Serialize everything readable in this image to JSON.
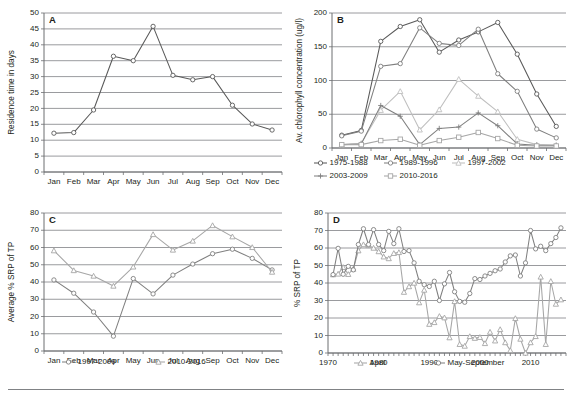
{
  "figure": {
    "name": "four-panel-limnology-figure",
    "panels": [
      "A",
      "B",
      "C",
      "D"
    ],
    "colors": {
      "line_dark": "#595959",
      "line_mid": "#7f7f7f",
      "line_light": "#a6a6a6",
      "line_lighter": "#bfbfbf",
      "grid": "#808285",
      "axis": "#6d6e71",
      "text": "#231f20"
    }
  },
  "panelA": {
    "letter": "A",
    "ylabel": "Residence time in days",
    "xlabel": "",
    "chart_data": {
      "type": "line",
      "title": "",
      "xlabel": "",
      "ylabel": "Residence time in days",
      "ylim": [
        0,
        50
      ],
      "yticks": [
        0,
        5,
        10,
        15,
        20,
        25,
        30,
        35,
        40,
        45,
        50
      ],
      "grid": true,
      "legend": "none",
      "categories": [
        "Jan",
        "Feb",
        "Mar",
        "Apr",
        "May",
        "Jun",
        "Jul",
        "Aug",
        "Sep",
        "Oct",
        "Nov",
        "Dec"
      ],
      "series": [
        {
          "name": "Residence time",
          "marker": "circle",
          "color": "#595959",
          "values": [
            12.2,
            12.4,
            19.5,
            36.4,
            35.0,
            45.8,
            30.4,
            29.0,
            30.0,
            21.0,
            15.1,
            13.2
          ]
        }
      ]
    }
  },
  "panelB": {
    "letter": "B",
    "ylabel": "Av. chlorophyll concentration (ug/l)",
    "chart_data": {
      "type": "line",
      "title": "",
      "xlabel": "",
      "ylabel": "Av. chlorophyll concentration (ug/l)",
      "ylim": [
        0,
        200
      ],
      "yticks": [
        0,
        50,
        100,
        150,
        200
      ],
      "grid": true,
      "legend": "bottom",
      "categories": [
        "Jan",
        "Feb",
        "Mar",
        "Apr",
        "May",
        "Jun",
        "Jul",
        "Aug",
        "Sep",
        "Oct",
        "Nov",
        "Dec"
      ],
      "series": [
        {
          "name": "1975-1988",
          "marker": "circle",
          "color": "#595959",
          "values": [
            19,
            26,
            158,
            180,
            190,
            142,
            160,
            172,
            186,
            139,
            80,
            32
          ]
        },
        {
          "name": "1989-1996",
          "marker": "circle",
          "color": "#7f7f7f",
          "values": [
            18,
            25,
            121,
            125,
            178,
            155,
            152,
            176,
            110,
            84,
            28,
            15
          ]
        },
        {
          "name": "1997-2002",
          "marker": "triangle",
          "color": "#bfbfbf",
          "values": [
            5,
            7,
            56,
            84,
            27,
            57,
            102,
            77,
            54,
            13,
            5,
            4
          ]
        },
        {
          "name": "2003-2009",
          "marker": "cross",
          "color": "#808080",
          "values": [
            5,
            6,
            63,
            47,
            5,
            29,
            31,
            52,
            33,
            6,
            4,
            4
          ]
        },
        {
          "name": "2010-2016",
          "marker": "square",
          "color": "#a6a6a6",
          "values": [
            5,
            5,
            11,
            13,
            4,
            11,
            16,
            23,
            14,
            4,
            3,
            3
          ]
        }
      ]
    }
  },
  "panelC": {
    "letter": "C",
    "ylabel": "Average  % SRP of TP",
    "chart_data": {
      "type": "line",
      "title": "",
      "xlabel": "",
      "ylabel": "Average  % SRP of TP",
      "ylim": [
        0,
        80
      ],
      "yticks": [
        0,
        10,
        20,
        30,
        40,
        50,
        60,
        70,
        80
      ],
      "grid": true,
      "legend": "bottom",
      "categories": [
        "Jan",
        "Feb",
        "Mar",
        "Apr",
        "May",
        "Jun",
        "Jul",
        "Aug",
        "Sep",
        "Oct",
        "Nov",
        "Dec"
      ],
      "series": [
        {
          "name": "1997-2009",
          "marker": "circle",
          "color": "#808080",
          "values": [
            41.2,
            33.5,
            22.6,
            8.6,
            42.0,
            33.1,
            44.0,
            50.4,
            56.4,
            59.0,
            53.7,
            47.0
          ]
        },
        {
          "name": "2010-2016",
          "marker": "triangle",
          "color": "#a6a6a6",
          "values": [
            58.2,
            46.7,
            43.5,
            37.7,
            48.8,
            67.6,
            58.6,
            63.8,
            72.8,
            66.3,
            60.1,
            45.8
          ]
        }
      ]
    }
  },
  "panelD": {
    "letter": "D",
    "ylabel": "% SRP of TP",
    "chart_data": {
      "type": "line",
      "title": "",
      "xlabel": "",
      "ylabel": "% SRP of TP",
      "ylim": [
        0,
        80
      ],
      "yticks": [
        0,
        10,
        20,
        30,
        40,
        50,
        60,
        70,
        80
      ],
      "xlim": [
        1970,
        2017
      ],
      "xticks": [
        1970,
        1980,
        1990,
        2000,
        2010
      ],
      "grid": true,
      "legend": "bottom",
      "x": [
        1971,
        1972,
        1973,
        1974,
        1975,
        1976,
        1977,
        1978,
        1979,
        1980,
        1981,
        1982,
        1983,
        1984,
        1985,
        1986,
        1987,
        1988,
        1989,
        1990,
        1991,
        1992,
        1993,
        1994,
        1995,
        1996,
        1997,
        1998,
        1999,
        2000,
        2001,
        2002,
        2003,
        2004,
        2005,
        2006,
        2007,
        2008,
        2009,
        2010,
        2011,
        2012,
        2013,
        2014,
        2015,
        2016
      ],
      "series": [
        {
          "name": "April",
          "marker": "triangle",
          "color": "#a6a6a6",
          "values": [
            44.8,
            45.2,
            49.0,
            45.0,
            48.0,
            58.5,
            62.0,
            61.5,
            60.0,
            58.0,
            55.0,
            54.0,
            57.0,
            57.5,
            34.8,
            38.0,
            40.0,
            28.8,
            36.0,
            16.5,
            17.5,
            21.0,
            20.2,
            8.8,
            29.5,
            5.0,
            4.0,
            9.5,
            8.5,
            9.0,
            5.5,
            12.0,
            7.0,
            13.5,
            6.0,
            1.5,
            19.8,
            8.0,
            0.0,
            6.0,
            9.5,
            43.5,
            5.0,
            41.0,
            28.0,
            30.5
          ]
        },
        {
          "name": "May-September",
          "marker": "circle",
          "color": "#808080",
          "values": [
            44.8,
            59.8,
            45.0,
            49.5,
            47.5,
            62.0,
            71.0,
            62.0,
            70.5,
            62.0,
            58.5,
            69.5,
            62.5,
            71.0,
            58.0,
            58.5,
            51.5,
            41.0,
            39.0,
            38.0,
            41.0,
            30.0,
            39.5,
            46.0,
            35.0,
            29.5,
            29.0,
            34.0,
            42.5,
            42.0,
            44.0,
            45.5,
            47.0,
            48.0,
            52.0,
            55.5,
            56.0,
            44.0,
            51.5,
            70.0,
            59.5,
            61.0,
            58.5,
            62.5,
            66.0,
            71.5
          ]
        }
      ]
    }
  }
}
